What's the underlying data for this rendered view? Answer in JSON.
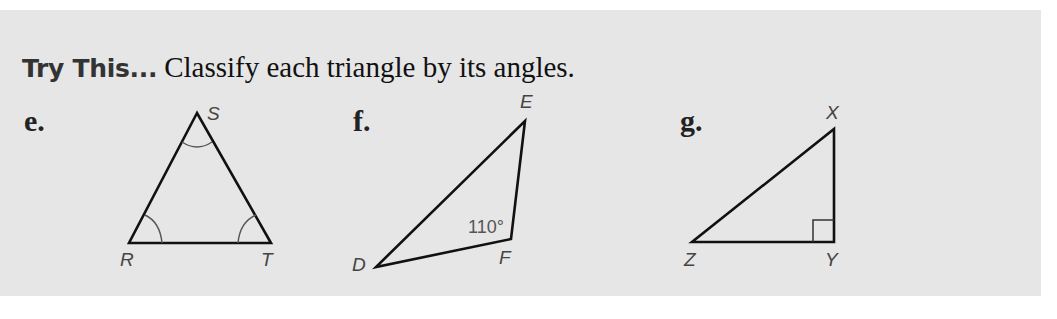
{
  "heading": {
    "lead": "Try This...",
    "instruction": "Classify each triangle by its angles."
  },
  "problems": [
    {
      "label": "e.",
      "vertices": [
        {
          "name": "S",
          "x": 197,
          "y": 113
        },
        {
          "name": "R",
          "x": 129,
          "y": 243
        },
        {
          "name": "T",
          "x": 271,
          "y": 243
        }
      ],
      "marks": "all three angles marked congruent (single arcs)"
    },
    {
      "label": "f.",
      "vertices": [
        {
          "name": "E",
          "x": 525,
          "y": 121
        },
        {
          "name": "F",
          "x": 511,
          "y": 239
        },
        {
          "name": "D",
          "x": 376,
          "y": 267
        }
      ],
      "angle_measure": "110°",
      "angle_at": "F"
    },
    {
      "label": "g.",
      "vertices": [
        {
          "name": "X",
          "x": 834,
          "y": 129
        },
        {
          "name": "Y",
          "x": 834,
          "y": 242
        },
        {
          "name": "Z",
          "x": 692,
          "y": 242
        }
      ],
      "marks": "right angle at Y"
    }
  ],
  "colors": {
    "panel": "#e6e6e6",
    "stroke": "#111111",
    "arc": "#555555",
    "label_text": "#444444"
  }
}
